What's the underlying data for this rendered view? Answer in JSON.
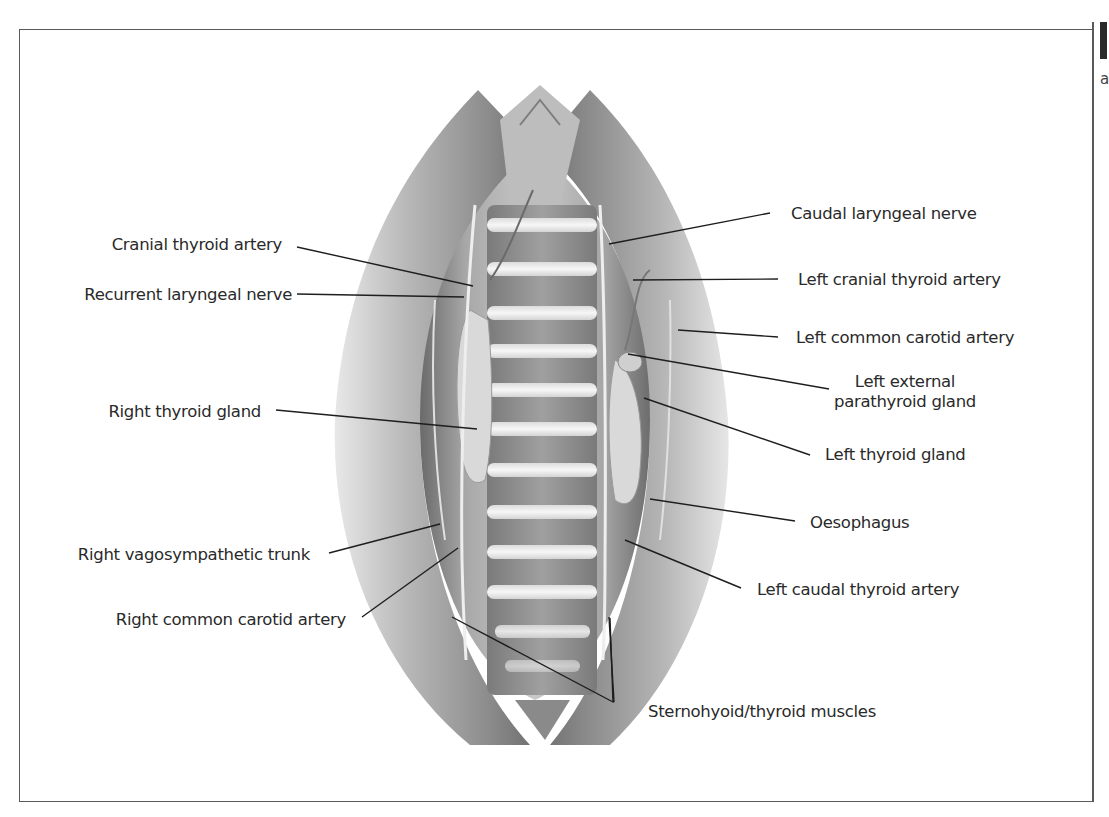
{
  "figure": {
    "corner_letter": "a",
    "labels_left": [
      {
        "id": "cranial-thyroid-artery",
        "text": "Cranial thyroid artery"
      },
      {
        "id": "recurrent-laryngeal-nerve",
        "text": "Recurrent laryngeal nerve"
      },
      {
        "id": "right-thyroid-gland",
        "text": "Right thyroid gland"
      },
      {
        "id": "right-vagosympathetic-trunk",
        "text": "Right vagosympathetic trunk"
      },
      {
        "id": "right-common-carotid-artery",
        "text": "Right common carotid artery"
      }
    ],
    "labels_right": [
      {
        "id": "caudal-laryngeal-nerve",
        "text": "Caudal laryngeal nerve"
      },
      {
        "id": "left-cranial-thyroid-artery",
        "text": "Left cranial thyroid artery"
      },
      {
        "id": "left-common-carotid-artery",
        "text": "Left common carotid artery"
      },
      {
        "id": "left-external-parathyroid-gland",
        "text_line1": "Left external",
        "text_line2": "parathyroid gland"
      },
      {
        "id": "left-thyroid-gland",
        "text": "Left thyroid gland"
      },
      {
        "id": "oesophagus",
        "text": "Oesophagus"
      },
      {
        "id": "left-caudal-thyroid-artery",
        "text": "Left caudal thyroid artery"
      }
    ],
    "labels_bottom": [
      {
        "id": "sternohyoid-thyroid-muscles",
        "text": "Sternohyoid/thyroid muscles"
      }
    ],
    "colors": {
      "line": "#1e1e1e",
      "text": "#2a2a2a",
      "frame": "#5a5a5a"
    }
  }
}
